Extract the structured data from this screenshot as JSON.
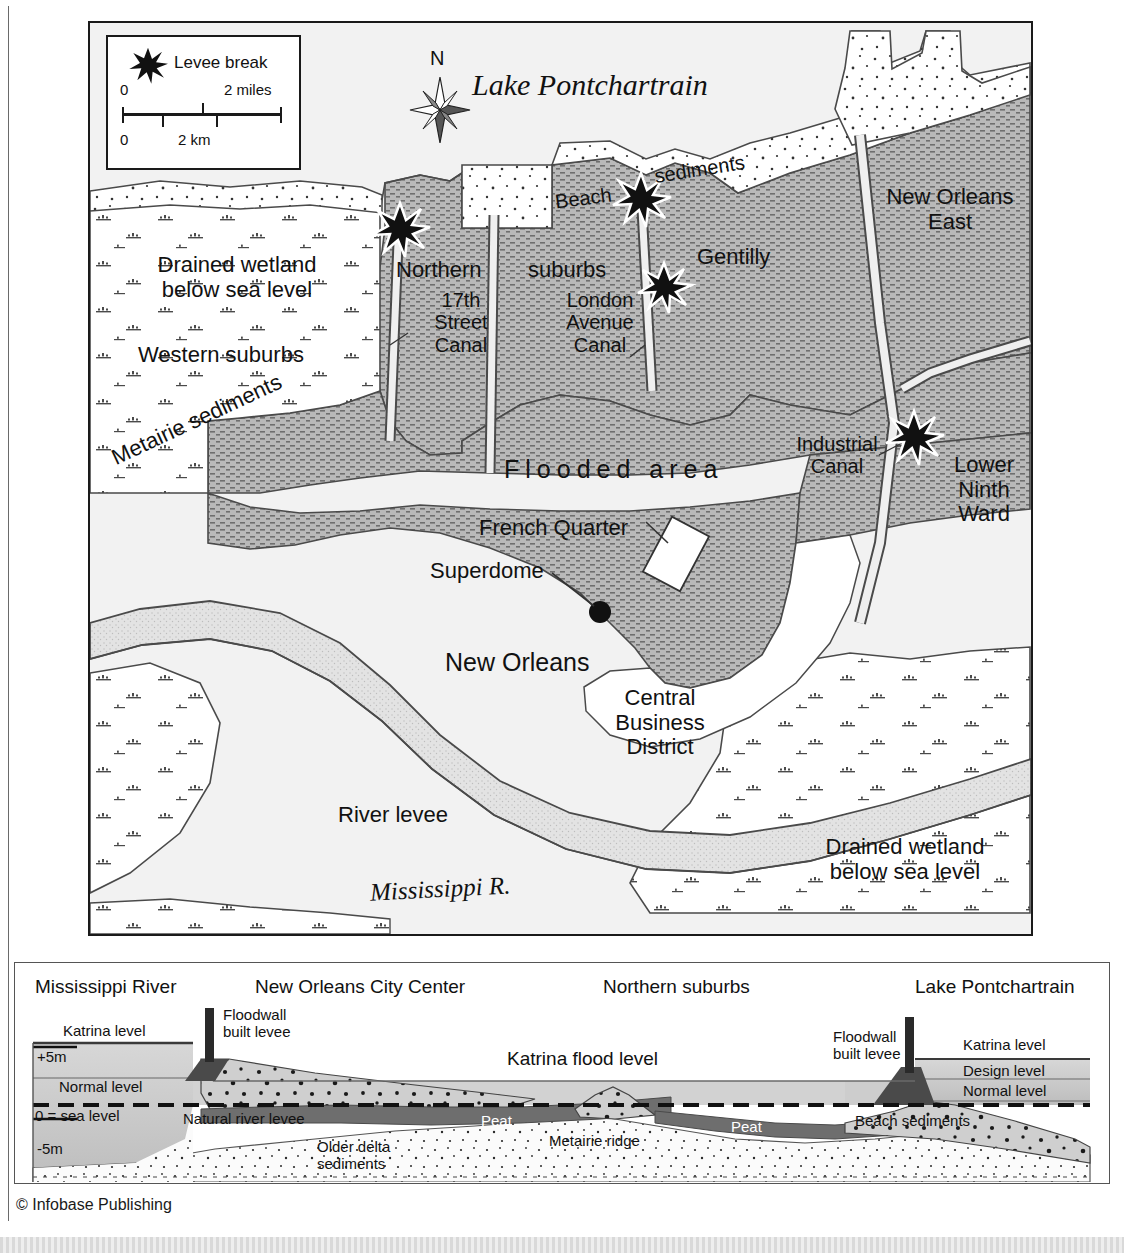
{
  "map": {
    "legend": {
      "symbol_name": "levee-break-star",
      "symbol_label": "Levee break",
      "scale_miles_start": "0",
      "scale_miles_end": "2 miles",
      "scale_km_start": "0",
      "scale_km_end": "2 km"
    },
    "compass_label": "N",
    "labels": {
      "lake": "Lake Pontchartrain",
      "beach": "Beach",
      "sediments": "sediments",
      "new_orleans_east": "New Orleans\nEast",
      "gentilly": "Gentilly",
      "northern": "Northern",
      "suburbs": "suburbs",
      "canal_17th": "17th\nStreet\nCanal",
      "london_avenue_canal": "London\nAvenue\nCanal",
      "drained_wetland_nw": "Drained wetland\nbelow sea level",
      "western_suburbs": "Western suburbs",
      "metairie_sediments": "Metairie sediments",
      "flooded_area": "Flooded area",
      "industrial_canal": "Industrial\nCanal",
      "lower_ninth_ward": "Lower\nNinth\nWard",
      "french_quarter": "French Quarter",
      "superdome": "Superdome",
      "new_orleans": "New Orleans",
      "cbd": "Central\nBusiness\nDistrict",
      "river_levee": "River levee",
      "mississippi_r": "Mississippi R.",
      "drained_wetland_se": "Drained wetland\nbelow sea level"
    },
    "levee_breaks": [
      {
        "name": "17th-street-canal-break",
        "x": 398,
        "y": 227
      },
      {
        "name": "london-avenue-canal-north-break",
        "x": 639,
        "y": 197
      },
      {
        "name": "london-avenue-canal-south-break",
        "x": 662,
        "y": 285
      },
      {
        "name": "industrial-canal-break",
        "x": 912,
        "y": 435
      }
    ]
  },
  "cross_section": {
    "headers": {
      "mississippi_river": "Mississippi River",
      "city_center": "New Orleans City Center",
      "northern_suburbs": "Northern suburbs",
      "lake": "Lake Pontchartrain"
    },
    "axis": {
      "plus5": "+5m",
      "sea": "0 = sea level",
      "minus5": "-5m"
    },
    "labels": {
      "katrina_level_left": "Katrina level",
      "normal_level_left": "Normal level",
      "floodwall_left": "Floodwall\nbuilt levee",
      "natural_river_levee": "Natural river levee",
      "older_delta_sediments": "Older delta\nsediments",
      "katrina_flood_level": "Katrina flood level",
      "peat_left": "Peat",
      "metairie_ridge": "Metairie ridge",
      "peat_right": "Peat",
      "floodwall_right": "Floodwall\nbuilt levee",
      "katrina_level_right": "Katrina level",
      "design_level": "Design level",
      "normal_level_right": "Normal level",
      "beach_sediments": "Beach sediments"
    }
  },
  "copyright": "© Infobase Publishing",
  "colors": {
    "flooded_fill": "#b8b8b8",
    "wetland_fill": "#ffffff",
    "levee_fill": "#e0e0e0",
    "sediment_fill": "#ffffff",
    "ink": "#1a1a1a",
    "map_bg": "#f2f2f2",
    "peat": "#6a6a6a",
    "water": "#c9c9c9"
  }
}
